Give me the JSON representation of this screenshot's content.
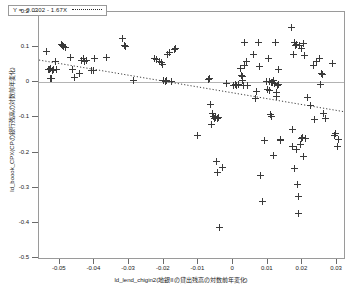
{
  "chart_data": {
    "type": "scatter",
    "title": "",
    "xlabel": "ld_lend_chigin2(地銀IIの貸出残高の対数前年変化)",
    "ylabel": "ld_boook_CPX(CPの銀行残高の対数前年変化)",
    "xlim": [
      -0.056,
      0.032
    ],
    "ylim": [
      -0.5,
      0.2
    ],
    "xticks": [
      -0.05,
      -0.04,
      -0.03,
      -0.02,
      -0.01,
      0,
      0.01,
      0.02,
      0.03
    ],
    "xticklabels": [
      "-0.05",
      "-0.04",
      "-0.03",
      "-0.02",
      "-0.01",
      "0",
      "0.01",
      "0.02",
      "0.03"
    ],
    "yticks": [
      0.2,
      0.1,
      0,
      -0.1,
      -0.2,
      -0.3,
      -0.4,
      -0.5
    ],
    "yticklabels": [
      "0.2",
      "0.1",
      "0",
      "-0.1",
      "-0.2",
      "-0.3",
      "-0.4",
      "-0.5"
    ],
    "grid": false,
    "marker": "plus",
    "marker_color": "#3a3a3a",
    "frame_color": "#9a9a9a",
    "zero_line": true,
    "zero_line_color": "#b4b4b4",
    "legend": {
      "position": "top-left",
      "equation": "Y = -0.0302 - 1.67X",
      "line_style": "dotted"
    },
    "fit": {
      "intercept": -0.0302,
      "slope": -1.67,
      "style": "dotted",
      "color": "#2a2a2a"
    },
    "points": [
      [
        -0.0538,
        0.089
      ],
      [
        -0.0533,
        0.037
      ],
      [
        -0.053,
        0.035
      ],
      [
        -0.0528,
        0.04
      ],
      [
        -0.0526,
        0.012
      ],
      [
        -0.0524,
        0.01
      ],
      [
        -0.0521,
        0.034
      ],
      [
        -0.0518,
        0.036
      ],
      [
        -0.0512,
        0.058
      ],
      [
        -0.051,
        0.037
      ],
      [
        -0.0495,
        0.108
      ],
      [
        -0.0492,
        0.104
      ],
      [
        -0.0488,
        0.101
      ],
      [
        -0.0483,
        0.099
      ],
      [
        -0.047,
        0.071
      ],
      [
        -0.0462,
        0.035
      ],
      [
        -0.0458,
        0.013
      ],
      [
        -0.0444,
        0.025
      ],
      [
        -0.0436,
        0.063
      ],
      [
        -0.0432,
        0.068
      ],
      [
        -0.0428,
        0.059
      ],
      [
        -0.0424,
        0.063
      ],
      [
        -0.0408,
        0.034
      ],
      [
        -0.0404,
        0.033
      ],
      [
        -0.04,
        0.069
      ],
      [
        -0.0366,
        0.07
      ],
      [
        -0.0318,
        0.124
      ],
      [
        -0.0314,
        0.104
      ],
      [
        -0.031,
        0.102
      ],
      [
        -0.0288,
        0.005
      ],
      [
        -0.0226,
        0.067
      ],
      [
        -0.0222,
        0.064
      ],
      [
        -0.0212,
        0.06
      ],
      [
        -0.0208,
        0.055
      ],
      [
        -0.0204,
        0.051
      ],
      [
        -0.02,
        0.004
      ],
      [
        -0.0196,
        0.002
      ],
      [
        -0.0192,
        0.005
      ],
      [
        -0.0188,
        0.08
      ],
      [
        -0.0184,
        0.084
      ],
      [
        -0.0178,
        0.003
      ],
      [
        -0.017,
        0.092
      ],
      [
        -0.0166,
        0.095
      ],
      [
        -0.0102,
        -0.15
      ],
      [
        -0.0072,
        0.008
      ],
      [
        -0.0068,
        0.012
      ],
      [
        -0.0064,
        -0.063
      ],
      [
        -0.0062,
        -0.12
      ],
      [
        -0.0058,
        -0.09
      ],
      [
        -0.0056,
        -0.096
      ],
      [
        -0.0054,
        -0.104
      ],
      [
        -0.0052,
        -0.1
      ],
      [
        -0.005,
        -0.098
      ],
      [
        -0.0048,
        -0.225
      ],
      [
        -0.0046,
        -0.104
      ],
      [
        -0.0044,
        -0.256
      ],
      [
        -0.0042,
        -0.101
      ],
      [
        -0.004,
        -0.413
      ],
      [
        -0.003,
        -0.242
      ],
      [
        -0.002,
        -0.004
      ],
      [
        0.0002,
        -0.008
      ],
      [
        0.0006,
        -0.006
      ],
      [
        0.001,
        -0.01
      ],
      [
        0.0016,
        -0.005
      ],
      [
        0.002,
        0.04
      ],
      [
        0.0024,
        0.018
      ],
      [
        0.0026,
        0.016
      ],
      [
        0.0028,
        0.004
      ],
      [
        0.003,
        -0.008
      ],
      [
        0.0032,
        0.048
      ],
      [
        0.0034,
        0.113
      ],
      [
        0.0038,
        0.058
      ],
      [
        0.0042,
        -0.01
      ],
      [
        0.006,
        0.078
      ],
      [
        0.0064,
        -0.046
      ],
      [
        0.0068,
        -0.026
      ],
      [
        0.0072,
        0.113
      ],
      [
        0.0076,
        0.044
      ],
      [
        0.008,
        -0.266
      ],
      [
        0.0084,
        -0.34
      ],
      [
        0.009,
        -0.166
      ],
      [
        0.0096,
        0.001
      ],
      [
        0.01,
        -0.021
      ],
      [
        0.0102,
        0.068
      ],
      [
        0.0104,
        0.002
      ],
      [
        0.0106,
        -0.024
      ],
      [
        0.0108,
        -0.093
      ],
      [
        0.011,
        -0.097
      ],
      [
        0.0112,
        0.0
      ],
      [
        0.0114,
        -0.002
      ],
      [
        0.0116,
        -0.208
      ],
      [
        0.0118,
        0.006
      ],
      [
        0.012,
        -0.004
      ],
      [
        0.0122,
        0.113
      ],
      [
        0.0124,
        -0.03
      ],
      [
        0.0126,
        -0.04
      ],
      [
        0.0128,
        -0.01
      ],
      [
        0.013,
        0.036
      ],
      [
        0.0132,
        -0.006
      ],
      [
        0.0136,
        -0.165
      ],
      [
        0.0138,
        -0.162
      ],
      [
        0.0168,
        0.155
      ],
      [
        0.017,
        -0.133
      ],
      [
        0.0172,
        -0.184
      ],
      [
        0.0174,
        0.079
      ],
      [
        0.0176,
        -0.245
      ],
      [
        0.0178,
        0.113
      ],
      [
        0.018,
        0.105
      ],
      [
        0.0182,
        0.108
      ],
      [
        0.0184,
        -0.19
      ],
      [
        0.0186,
        -0.29
      ],
      [
        0.0188,
        -0.325
      ],
      [
        0.019,
        -0.374
      ],
      [
        0.0192,
        0.106
      ],
      [
        0.0194,
        -0.178
      ],
      [
        0.0196,
        0.095
      ],
      [
        0.0198,
        -0.16
      ],
      [
        0.02,
        -0.158
      ],
      [
        0.0202,
        0.11
      ],
      [
        0.0204,
        -0.212
      ],
      [
        0.0206,
        0.077
      ],
      [
        0.021,
        -0.159
      ],
      [
        0.0216,
        -0.044
      ],
      [
        0.0222,
        -0.065
      ],
      [
        0.0232,
        0.048
      ],
      [
        0.0236,
        -0.106
      ],
      [
        0.0242,
        0.058
      ],
      [
        0.0248,
        0.067
      ],
      [
        0.0252,
        -0.005
      ],
      [
        0.0256,
        0.024
      ],
      [
        0.0258,
        0.021
      ],
      [
        0.0262,
        -0.088
      ],
      [
        0.0268,
        -0.102
      ],
      [
        0.0288,
        0.053
      ],
      [
        0.0292,
        -0.152
      ],
      [
        0.0296,
        -0.145
      ],
      [
        0.03,
        -0.184
      ],
      [
        0.0304,
        -0.163
      ]
    ]
  }
}
